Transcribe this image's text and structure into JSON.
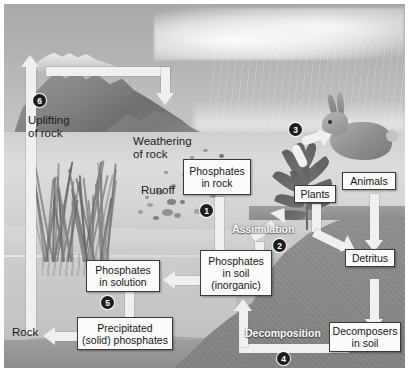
{
  "figure": {
    "type": "scientific-cycle-diagram"
  },
  "boxes": [
    {
      "id": "phosphates-in-rock",
      "label": "Phosphates\nin rock"
    },
    {
      "id": "phosphates-in-soil",
      "label": "Phosphates\nin soil\n(inorganic)"
    },
    {
      "id": "phosphates-in-solution",
      "label": "Phosphates\nin solution"
    },
    {
      "id": "precipitated-phosphates",
      "label": "Precipitated\n(solid) phosphates"
    },
    {
      "id": "plants",
      "label": "Plants"
    },
    {
      "id": "animals",
      "label": "Animals"
    },
    {
      "id": "detritus",
      "label": "Detritus"
    },
    {
      "id": "decomposers-in-soil",
      "label": "Decomposers\nin soil"
    }
  ],
  "scene_labels": [
    {
      "id": "uplifting-of-rock",
      "label": "Uplifting\nof rock"
    },
    {
      "id": "weathering-of-rock",
      "label": "Weathering\nof rock"
    },
    {
      "id": "runoff",
      "label": "Runoff"
    },
    {
      "id": "rock",
      "label": "Rock"
    }
  ],
  "process_labels": [
    {
      "id": "assimilation",
      "label": "Assimilation"
    },
    {
      "id": "decomposition",
      "label": "Decomposition"
    }
  ],
  "step_markers": [
    {
      "id": "step-1",
      "number": "1",
      "near": "phosphates-in-rock"
    },
    {
      "id": "step-2",
      "number": "2",
      "near": "assimilation"
    },
    {
      "id": "step-3",
      "number": "3",
      "near": "plants-to-animals"
    },
    {
      "id": "step-4",
      "number": "4",
      "near": "decomposition"
    },
    {
      "id": "step-5",
      "number": "5",
      "near": "phosphates-in-solution"
    },
    {
      "id": "step-6",
      "number": "6",
      "near": "uplifting-of-rock"
    }
  ],
  "colors": {
    "arrow": "#f0f0f0",
    "box_fill": "#fbfbfb",
    "box_border": "#3a3a3a",
    "marker_fill": "#1d1d1d",
    "marker_text": "#ffffff",
    "soil_dark": "#898989",
    "water": "#c6c6c6",
    "sky": "#b0b0b0"
  }
}
